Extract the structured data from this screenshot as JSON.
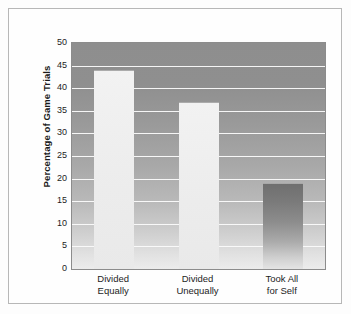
{
  "chart_data": {
    "type": "bar",
    "title": "",
    "xlabel": "",
    "ylabel": "Percentage of Game Trials",
    "categories": [
      "Divided Equally",
      "Divided Unequally",
      "Took All for Self"
    ],
    "category_lines": [
      [
        "Divided",
        "Equally"
      ],
      [
        "Divided",
        "Unequally"
      ],
      [
        "Took All",
        "for Self"
      ]
    ],
    "values": [
      44,
      37,
      19
    ],
    "ylim": [
      0,
      50
    ],
    "ytick_values": [
      0,
      5,
      10,
      15,
      20,
      25,
      30,
      35,
      40,
      45,
      50
    ],
    "ytick_labels": [
      "0",
      "5",
      "10",
      "15",
      "20",
      "25",
      "30",
      "35",
      "40",
      "45",
      "50"
    ],
    "grid": true,
    "legend": false,
    "legend_position": "none",
    "bar_styles": [
      "light",
      "light",
      "dark"
    ],
    "colors": {
      "bar_light_top": "#f2f2f2",
      "bar_light_bottom": "#e9e9e9",
      "bar_dark_top": "#6f6f6f",
      "bar_dark_bottom": "#e4e4e4",
      "plot_bg_top": "#8e8e8e",
      "plot_bg_bottom": "#ececec",
      "gridline": "#fbfbfb",
      "axis": "#8c8c8c",
      "frame": "#b7b7b7",
      "text": "#1d1d1d",
      "page_bg": "#fdfdfd"
    }
  }
}
